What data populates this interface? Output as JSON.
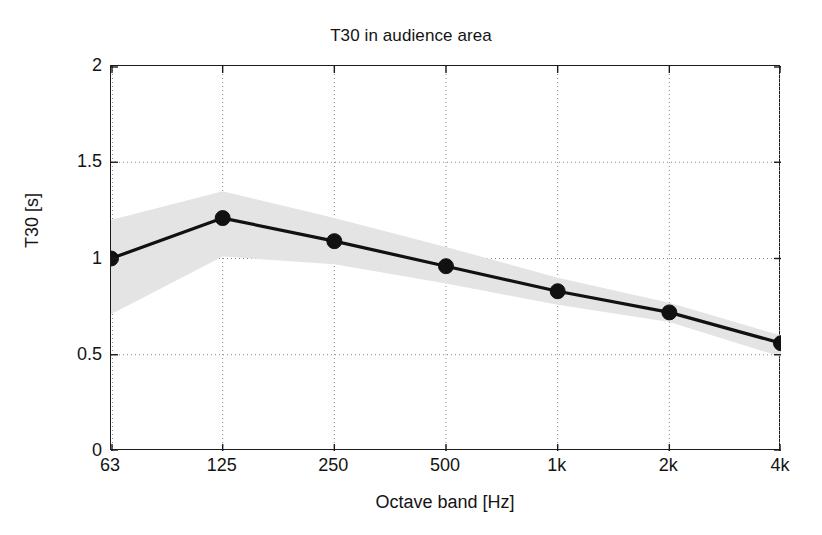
{
  "chart_data": {
    "type": "line",
    "title": "T30 in audience area",
    "xlabel": "Octave band [Hz]",
    "ylabel": "T30 [s]",
    "categories": [
      "63",
      "125",
      "250",
      "500",
      "1k",
      "2k",
      "4k"
    ],
    "values": [
      1.0,
      1.21,
      1.09,
      0.96,
      0.83,
      0.72,
      0.56
    ],
    "series": [
      {
        "name": "T30 mean",
        "values": [
          1.0,
          1.21,
          1.09,
          0.96,
          0.83,
          0.72,
          0.56
        ]
      },
      {
        "name": "range band upper",
        "values": [
          1.2,
          1.35,
          1.21,
          1.06,
          0.9,
          0.77,
          0.6
        ]
      },
      {
        "name": "range band lower",
        "values": [
          0.71,
          1.01,
          0.97,
          0.87,
          0.76,
          0.67,
          0.49
        ]
      }
    ],
    "ylim": [
      0,
      2
    ],
    "yticks": [
      "0",
      "0.5",
      "1",
      "1.5",
      "2"
    ],
    "ytickvalues": [
      0,
      0.5,
      1,
      1.5,
      2
    ],
    "grid": true,
    "legend": "none",
    "line_color": "#111111",
    "marker_color": "#111111",
    "band_color": "#e4e4e4",
    "grid_color": "#8a8a8a",
    "axis_color": "#1b1b1b",
    "background": "#ffffff"
  }
}
